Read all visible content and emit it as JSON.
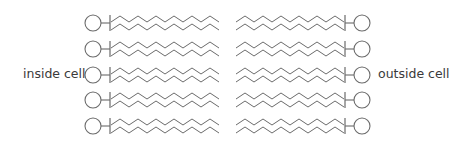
{
  "labels": {
    "inside": "inside cell",
    "outside": "outside cell"
  },
  "diagram": {
    "type": "phospholipid-layer",
    "rows": 5,
    "row_y": [
      23,
      49,
      75,
      100,
      126
    ],
    "stroke_color": "#6b6b6b",
    "head_radius": 8,
    "left": {
      "head_cx": 93,
      "bar_x": 110,
      "chain_start_x": 111,
      "chain_end_x": 219,
      "direction": "right"
    },
    "right": {
      "head_cx": 362,
      "bar_x": 345,
      "chain_start_x": 344,
      "chain_end_x": 236,
      "direction": "left"
    },
    "zigzag": {
      "period": 18,
      "amplitude": 6,
      "upper_offset": -4,
      "lower_offset": 4
    }
  }
}
